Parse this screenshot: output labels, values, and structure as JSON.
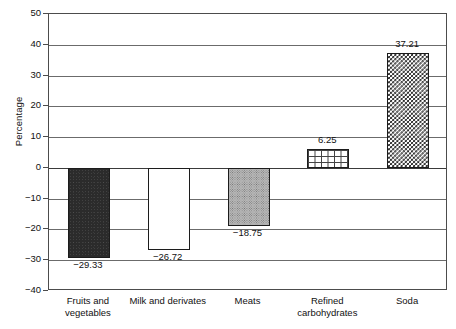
{
  "chart_data": {
    "type": "bar",
    "title": "",
    "subtitle": "",
    "xlabel": "",
    "ylabel": "Percentage",
    "categories": [
      "Fruits and\nvegetables",
      "Milk and derivates",
      "Meats",
      "Refined\ncarbohydrates",
      "Soda"
    ],
    "values": [
      -29.33,
      -26.72,
      -18.75,
      6.25,
      37.21
    ],
    "data_labels": [
      "−29.33",
      "−26.72",
      "−18.75",
      "6.25",
      "37.21"
    ],
    "ylim": [
      -40,
      50
    ],
    "yticks": [
      50,
      40,
      30,
      20,
      10,
      0,
      -10,
      -20,
      -30,
      -40
    ],
    "ytick_labels": [
      "50",
      "40",
      "30",
      "20",
      "10",
      "0",
      "−10",
      "−20",
      "−30",
      "−40"
    ],
    "grid": true,
    "grid_axis": "y",
    "legend": false,
    "legend_position": "none",
    "bar_patterns": [
      "solid-black",
      "hollow-white",
      "gray-stipple",
      "brick",
      "checkerboard"
    ],
    "colors": {
      "frame": "#4c4c4c",
      "gridline": "#6b6b6b",
      "zero_line": "#3a3a3a",
      "bar_outline": "#1c1c1c",
      "solid_fill": "#2b2b2b",
      "stipple_fill": "#b9b9b9",
      "text": "#111111",
      "background": "#ffffff"
    }
  }
}
